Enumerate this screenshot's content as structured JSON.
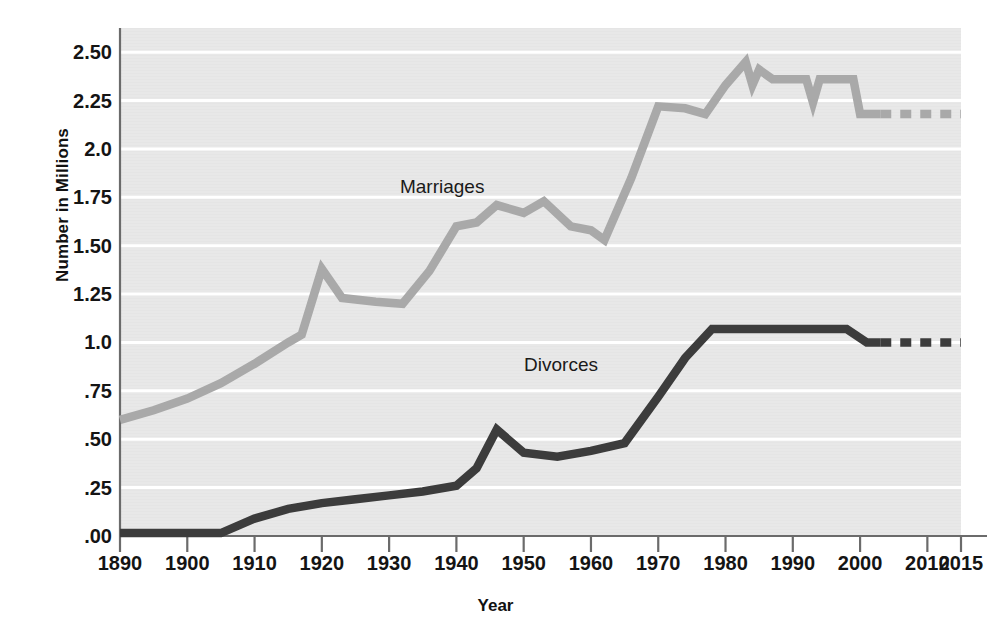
{
  "chart_data": {
    "type": "line",
    "title": "",
    "xlabel": "Year",
    "ylabel": "Number in Millions",
    "xlim": [
      1890,
      2015
    ],
    "ylim": [
      0,
      2.625
    ],
    "grid": true,
    "gridlines_y": [
      0.0,
      0.25,
      0.5,
      0.75,
      1.0,
      1.25,
      1.5,
      1.75,
      2.0,
      2.25,
      2.5
    ],
    "y_tick_labels": [
      ".00",
      ".25",
      ".50",
      ".75",
      "1.0",
      "1.25",
      "1.50",
      "1.75",
      "2.0",
      "2.25",
      "2.50"
    ],
    "y_tick_values": [
      0.0,
      0.25,
      0.5,
      0.75,
      1.0,
      1.25,
      1.5,
      1.75,
      2.0,
      2.25,
      2.5
    ],
    "x_tick_labels": [
      "1890",
      "1900",
      "1910",
      "1920",
      "1930",
      "1940",
      "1950",
      "1960",
      "1970",
      "1980",
      "1990",
      "2000",
      "2010",
      "2015"
    ],
    "x_tick_values": [
      1890,
      1900,
      1910,
      1920,
      1930,
      1940,
      1950,
      1960,
      1970,
      1980,
      1990,
      2000,
      2010,
      2015
    ],
    "legend_position": "inline-annotations",
    "plot_background": "#e8e8e8",
    "gridline_color": "#ffffff",
    "series": [
      {
        "name": "Marriages",
        "color": "#a9a9a9",
        "label_x": 1938,
        "label_y": 1.8,
        "solid_points": [
          [
            1890,
            0.6
          ],
          [
            1895,
            0.65
          ],
          [
            1900,
            0.71
          ],
          [
            1905,
            0.79
          ],
          [
            1910,
            0.89
          ],
          [
            1915,
            1.0
          ],
          [
            1917,
            1.04
          ],
          [
            1920,
            1.38
          ],
          [
            1923,
            1.23
          ],
          [
            1928,
            1.21
          ],
          [
            1932,
            1.2
          ],
          [
            1936,
            1.37
          ],
          [
            1940,
            1.6
          ],
          [
            1943,
            1.62
          ],
          [
            1946,
            1.71
          ],
          [
            1950,
            1.67
          ],
          [
            1953,
            1.73
          ],
          [
            1957,
            1.6
          ],
          [
            1960,
            1.58
          ],
          [
            1962,
            1.53
          ],
          [
            1966,
            1.85
          ],
          [
            1970,
            2.22
          ],
          [
            1974,
            2.21
          ],
          [
            1977,
            2.18
          ],
          [
            1980,
            2.33
          ],
          [
            1983,
            2.45
          ],
          [
            1984,
            2.33
          ],
          [
            1985,
            2.41
          ],
          [
            1987,
            2.36
          ],
          [
            1992,
            2.36
          ],
          [
            1993,
            2.24
          ],
          [
            1994,
            2.36
          ],
          [
            1999,
            2.36
          ],
          [
            2000,
            2.18
          ],
          [
            2003,
            2.18
          ]
        ],
        "dashed_points": [
          [
            2003,
            2.18
          ],
          [
            2015,
            2.18
          ]
        ]
      },
      {
        "name": "Divorces",
        "color": "#3c3c3c",
        "label_x": 1956,
        "label_y": 0.88,
        "solid_points": [
          [
            1890,
            0.015
          ],
          [
            1895,
            0.015
          ],
          [
            1900,
            0.015
          ],
          [
            1905,
            0.015
          ],
          [
            1910,
            0.09
          ],
          [
            1915,
            0.14
          ],
          [
            1920,
            0.17
          ],
          [
            1925,
            0.19
          ],
          [
            1930,
            0.21
          ],
          [
            1935,
            0.23
          ],
          [
            1940,
            0.26
          ],
          [
            1943,
            0.35
          ],
          [
            1946,
            0.55
          ],
          [
            1950,
            0.43
          ],
          [
            1955,
            0.41
          ],
          [
            1960,
            0.44
          ],
          [
            1965,
            0.48
          ],
          [
            1970,
            0.72
          ],
          [
            1974,
            0.92
          ],
          [
            1978,
            1.07
          ],
          [
            1990,
            1.07
          ],
          [
            1998,
            1.07
          ],
          [
            2001,
            1.0
          ],
          [
            2003,
            1.0
          ]
        ],
        "dashed_points": [
          [
            2003,
            1.0
          ],
          [
            2015,
            1.0
          ]
        ]
      }
    ]
  },
  "annotations": {
    "marriages_label": "Marriages",
    "divorces_label": "Divorces"
  },
  "axes": {
    "y_title": "Number in Millions",
    "x_title": "Year"
  },
  "colors": {
    "marriages": "#a9a9a9",
    "divorces": "#3c3c3c",
    "plot_bg": "#e8e8e8",
    "grid": "#ffffff",
    "axis": "#6b6b6b",
    "text": "#141414"
  }
}
